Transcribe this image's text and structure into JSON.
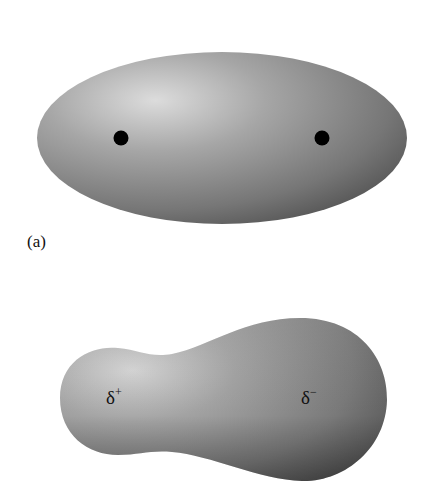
{
  "figure": {
    "panel_a": {
      "label": "(a)",
      "shape": "symmetric ellipsoid electron cloud",
      "nuclei": [
        {
          "name": "left-nucleus",
          "x": 121,
          "y": 138
        },
        {
          "name": "right-nucleus",
          "x": 322,
          "y": 138
        }
      ]
    },
    "panel_b": {
      "shape": "asymmetric polar electron cloud",
      "partial_charges": {
        "positive": {
          "symbol": "δ",
          "sign": "+"
        },
        "negative": {
          "symbol": "δ",
          "sign": "−"
        }
      }
    },
    "colors": {
      "cloud_light": "#d9d9d9",
      "cloud_mid": "#8a8a8a",
      "cloud_dark": "#4a4a4a",
      "nucleus": "#000000"
    }
  }
}
